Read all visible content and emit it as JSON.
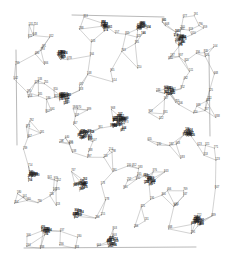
{
  "figure": {
    "kind": "network-graph",
    "title": "",
    "background_color": "#ffffff",
    "edge_color": "#9a9a9a",
    "label_color": "#3a3a3a",
    "dense_label_color": "#1c1c1c",
    "node_dot_color": "#4a4a4a",
    "width": 226,
    "height": 275,
    "plot_box": {
      "x0": 14,
      "y0": 12,
      "x1": 216,
      "y1": 252
    }
  },
  "chart_data": {
    "type": "scatter",
    "title": "",
    "xlabel": "",
    "ylabel": "",
    "grid": false,
    "legend": null,
    "xlim": [
      14,
      216
    ],
    "ylim": [
      12,
      252
    ],
    "node_count": 420,
    "edge_count": 560,
    "seed": 20240617,
    "clusters": [
      {
        "cx": 118,
        "cy": 123,
        "r": 13,
        "n": 34
      },
      {
        "cx": 63,
        "cy": 98,
        "r": 9,
        "n": 18
      },
      {
        "cx": 84,
        "cy": 136,
        "r": 10,
        "n": 20
      },
      {
        "cx": 179,
        "cy": 40,
        "r": 9,
        "n": 16
      },
      {
        "cx": 188,
        "cy": 135,
        "r": 8,
        "n": 14
      },
      {
        "cx": 196,
        "cy": 222,
        "r": 9,
        "n": 18
      },
      {
        "cx": 140,
        "cy": 29,
        "r": 8,
        "n": 14
      },
      {
        "cx": 103,
        "cy": 27,
        "r": 7,
        "n": 12
      },
      {
        "cx": 60,
        "cy": 56,
        "r": 8,
        "n": 13
      },
      {
        "cx": 31,
        "cy": 176,
        "r": 7,
        "n": 12
      },
      {
        "cx": 80,
        "cy": 186,
        "r": 9,
        "n": 16
      },
      {
        "cx": 148,
        "cy": 181,
        "r": 8,
        "n": 14
      },
      {
        "cx": 110,
        "cy": 243,
        "r": 8,
        "n": 14
      },
      {
        "cx": 44,
        "cy": 233,
        "r": 7,
        "n": 11
      },
      {
        "cx": 168,
        "cy": 92,
        "r": 8,
        "n": 13
      },
      {
        "cx": 76,
        "cy": 214,
        "r": 7,
        "n": 11
      }
    ],
    "boundary_edges": [
      {
        "name": "left-boundary",
        "x1": 16,
        "y1": 50,
        "x2": 17,
        "y2": 145
      },
      {
        "name": "right-boundary",
        "x1": 209,
        "y1": 55,
        "x2": 210,
        "y2": 136
      },
      {
        "name": "top-boundary",
        "x1": 72,
        "y1": 15,
        "x2": 164,
        "y2": 17
      },
      {
        "name": "bottom-boundary",
        "x1": 24,
        "y1": 248,
        "x2": 196,
        "y2": 247
      }
    ],
    "label_value_range": [
      100,
      999
    ],
    "label_format": "3-digit numeric"
  }
}
